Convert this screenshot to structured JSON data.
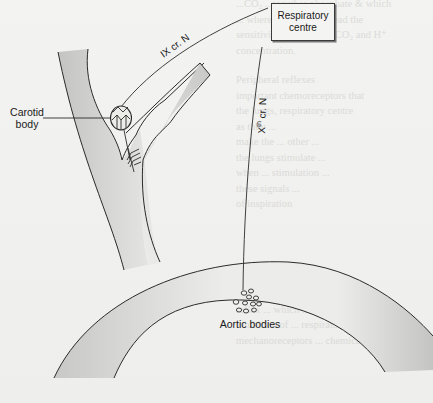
{
  "diagram": {
    "labels": {
      "respiratory_centre": "Respiratory centre",
      "carotid_body": "Carotid body",
      "aortic_bodies": "Aortic bodies",
      "glossopharyngeal_nerve": "IX cr. N",
      "vagus_nerve_main": "X",
      "vagus_nerve_sup": "th",
      "vagus_nerve_suffix": "cr. N"
    },
    "colors": {
      "line": "#2b2b2b",
      "vessel_fill": "#c9c9c7",
      "vessel_fill_light": "#e6e6e4",
      "background": "#f1f1ef"
    },
    "bleed_through_text": {
      "top": "...CO₂ ...together phosphate & which\n... where hypoxia will lead the\nsensitivity to increased CO₂ and H⁺\nconcentration.",
      "middle": "Peripheral reflexes\nimportant chemoreceptors that\nthe lungs, respiratory centre\nas they ...\nmake the ... other ...\nthe lungs stimulate ...\nwhen ... stimulation ...\nthese signals ...\nof inspiration",
      "bottom": "...  receptors ... ... Hering-Breuer\nreflex ... which ... due to the\ninhibition of ... respiratory centre\nmechanoreceptors ... chemical"
    }
  }
}
